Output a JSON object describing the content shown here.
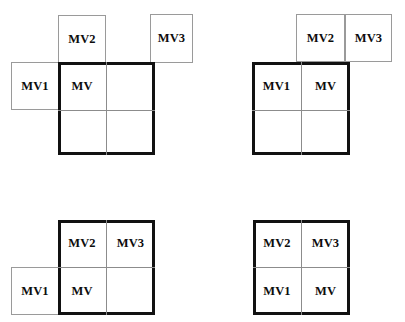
{
  "figure": {
    "title": "",
    "background_color": "#ffffff",
    "frame_color": "#111111",
    "satellite_border_color": "#9a9a9a",
    "divider_color": "#8c8c8c",
    "label_color": "#0d0d0d"
  },
  "labels": {
    "mv": "MV",
    "mv1": "MV1",
    "mv2": "MV2",
    "mv3": "MV3"
  },
  "panels": [
    {
      "id": "panel-top-left",
      "name": "stage-1",
      "inside": [
        {
          "key": "mv",
          "label": "MV",
          "row": 0,
          "col": 0
        }
      ],
      "outside": [
        {
          "key": "mv1",
          "label": "MV1",
          "position": "left-of-mv"
        },
        {
          "key": "mv2",
          "label": "MV2",
          "position": "above-mv"
        },
        {
          "key": "mv3",
          "label": "MV3",
          "position": "above-right-detached"
        }
      ]
    },
    {
      "id": "panel-top-right",
      "name": "stage-2",
      "inside": [
        {
          "key": "mv1",
          "label": "MV1",
          "row": 0,
          "col": 0
        },
        {
          "key": "mv",
          "label": "MV",
          "row": 0,
          "col": 1
        }
      ],
      "outside": [
        {
          "key": "mv2",
          "label": "MV2",
          "position": "above-mv"
        },
        {
          "key": "mv3",
          "label": "MV3",
          "position": "above-right"
        }
      ]
    },
    {
      "id": "panel-bottom-left",
      "name": "stage-3",
      "inside": [
        {
          "key": "mv2",
          "label": "MV2",
          "row": 0,
          "col": 0
        },
        {
          "key": "mv3",
          "label": "MV3",
          "row": 0,
          "col": 1
        },
        {
          "key": "mv",
          "label": "MV",
          "row": 1,
          "col": 0
        }
      ],
      "outside": [
        {
          "key": "mv1",
          "label": "MV1",
          "position": "left-of-mv"
        }
      ]
    },
    {
      "id": "panel-bottom-right",
      "name": "stage-4",
      "inside": [
        {
          "key": "mv2",
          "label": "MV2",
          "row": 0,
          "col": 0
        },
        {
          "key": "mv3",
          "label": "MV3",
          "row": 0,
          "col": 1
        },
        {
          "key": "mv1",
          "label": "MV1",
          "row": 1,
          "col": 0
        },
        {
          "key": "mv",
          "label": "MV",
          "row": 1,
          "col": 1
        }
      ],
      "outside": []
    }
  ]
}
